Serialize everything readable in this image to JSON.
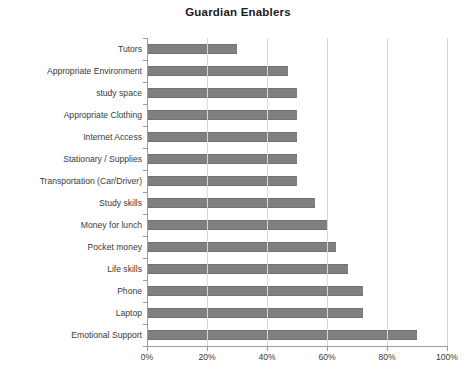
{
  "chart_data": {
    "type": "bar",
    "orientation": "horizontal",
    "title": "Guardian Enablers",
    "xlabel": "",
    "ylabel": "",
    "xlim": [
      0,
      100
    ],
    "xticks": [
      "0%",
      "20%",
      "40%",
      "60%",
      "80%",
      "100%"
    ],
    "xtick_values": [
      0,
      20,
      40,
      60,
      80,
      100
    ],
    "grid": "vertical",
    "legend": "none",
    "bar_color": "#808080",
    "categories": [
      "Tutors",
      "Appropriate Environment",
      "study space",
      "Appropriate Clothing",
      "Internet Access",
      "Stationary / Supplies",
      "Transportation (Car/Driver)",
      "Study skills",
      "Money for lunch",
      "Pocket money",
      "Life skills",
      "Phone",
      "Laptop",
      "Emotional Support"
    ],
    "values": [
      30,
      47,
      50,
      50,
      50,
      50,
      50,
      56,
      60,
      63,
      67,
      72,
      72,
      90
    ]
  }
}
